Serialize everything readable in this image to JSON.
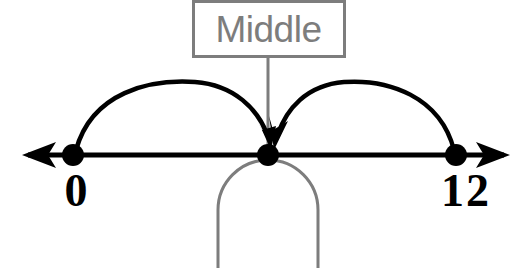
{
  "diagram": {
    "title_label": "Middle",
    "axis": {
      "name": "number-line",
      "left_endpoint_label": "0",
      "right_endpoint_label": "12",
      "left_arrow": "arrow-left",
      "right_arrow": "arrow-right"
    },
    "points": [
      {
        "label": "0",
        "value": 0
      },
      {
        "label": "",
        "value": 6
      },
      {
        "label": "12",
        "value": 12
      }
    ],
    "arcs": [
      {
        "name": "arc-from-zero-to-middle",
        "from": "0",
        "to": "middle"
      },
      {
        "name": "arc-from-twelve-to-middle",
        "from": "12",
        "to": "middle"
      }
    ],
    "callout": {
      "text": "Middle",
      "target": "middle-point"
    },
    "shapes": [
      {
        "name": "arch-outline"
      }
    ],
    "colors": {
      "line": "#000000",
      "callout": "#7d7d7d",
      "arch": "#7d7d7d",
      "background": "#ffffff"
    }
  }
}
